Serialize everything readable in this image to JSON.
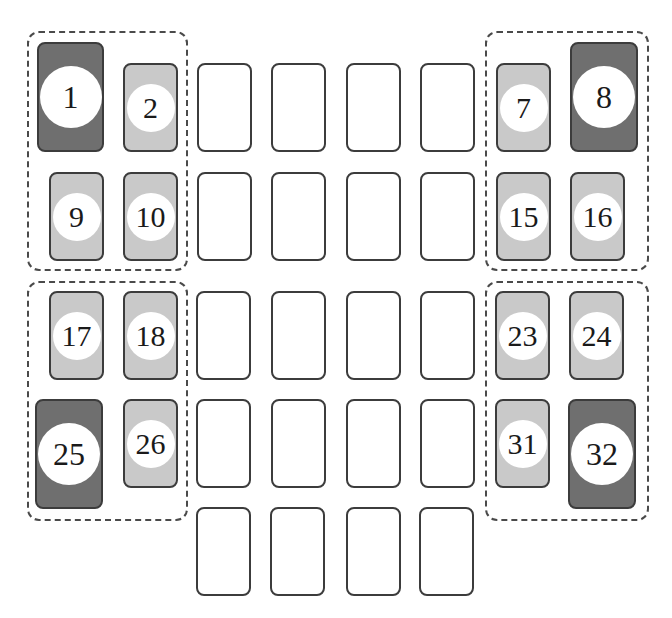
{
  "diagram": {
    "type": "fuse-box-layout",
    "groups": [
      {
        "id": "top-left",
        "x": 27,
        "y": 31,
        "w": 161,
        "h": 240
      },
      {
        "id": "top-right",
        "x": 485,
        "y": 31,
        "w": 164,
        "h": 240
      },
      {
        "id": "bottom-left",
        "x": 27,
        "y": 281,
        "w": 161,
        "h": 240
      },
      {
        "id": "bottom-right",
        "x": 485,
        "y": 281,
        "w": 164,
        "h": 240
      }
    ],
    "colors": {
      "light_fill": "#c9c9c9",
      "dark_fill": "#6f6f6f",
      "empty_fill": "#ffffff",
      "outline": "#3c3c3c"
    },
    "labeled_slots": [
      {
        "label": "1",
        "shade": "dark",
        "size": "big"
      },
      {
        "label": "2",
        "shade": "light",
        "size": "small"
      },
      {
        "label": "7",
        "shade": "light",
        "size": "small"
      },
      {
        "label": "8",
        "shade": "dark",
        "size": "big"
      },
      {
        "label": "9",
        "shade": "light",
        "size": "small"
      },
      {
        "label": "10",
        "shade": "light",
        "size": "small"
      },
      {
        "label": "15",
        "shade": "light",
        "size": "small"
      },
      {
        "label": "16",
        "shade": "light",
        "size": "small"
      },
      {
        "label": "17",
        "shade": "light",
        "size": "small"
      },
      {
        "label": "18",
        "shade": "light",
        "size": "small"
      },
      {
        "label": "23",
        "shade": "light",
        "size": "small"
      },
      {
        "label": "24",
        "shade": "light",
        "size": "small"
      },
      {
        "label": "25",
        "shade": "dark",
        "size": "big"
      },
      {
        "label": "26",
        "shade": "light",
        "size": "small"
      },
      {
        "label": "31",
        "shade": "light",
        "size": "small"
      },
      {
        "label": "32",
        "shade": "dark",
        "size": "big"
      }
    ],
    "empty_slot_count": 20
  }
}
